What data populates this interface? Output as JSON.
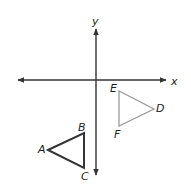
{
  "diagram": {
    "title": "",
    "axes": {
      "x_label": "x",
      "y_label": "y",
      "origin": [
        96,
        80
      ],
      "color": "#333333"
    },
    "triangles": [
      {
        "name": "ABC",
        "color": "#333333",
        "vertices": [
          {
            "label": "A",
            "x": 48,
            "y": 150
          },
          {
            "label": "B",
            "x": 84,
            "y": 133
          },
          {
            "label": "C",
            "x": 84,
            "y": 168
          }
        ]
      },
      {
        "name": "DEF",
        "color": "#9a9a9a",
        "vertices": [
          {
            "label": "D",
            "x": 154,
            "y": 109
          },
          {
            "label": "E",
            "x": 119,
            "y": 91
          },
          {
            "label": "F",
            "x": 119,
            "y": 126
          }
        ]
      }
    ]
  }
}
